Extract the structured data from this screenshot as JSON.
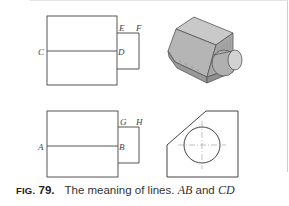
{
  "figure": {
    "top_view_labels": {
      "left": "C",
      "mid": "D",
      "top_inner": "E",
      "top_outer": "F"
    },
    "bottom_view_labels": {
      "left": "A",
      "mid": "B",
      "top_inner": "G",
      "top_outer": "H"
    },
    "pictorial_top": "isometric-block-with-cylinder",
    "pictorial_bottom": "chamfered-face-with-circle"
  },
  "caption": {
    "fig_word": "FIG.",
    "fig_number": "79.",
    "text_pre": "The meaning of lines.",
    "var1": "AB",
    "and": "and",
    "var2": "CD"
  }
}
